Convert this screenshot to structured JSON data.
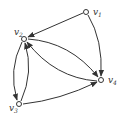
{
  "graph": {
    "type": "directed",
    "nodes": [
      {
        "id": "v1",
        "label": "v",
        "sub": "1",
        "x": 86,
        "y": 12
      },
      {
        "id": "v2",
        "label": "v",
        "sub": "2",
        "x": 24,
        "y": 39
      },
      {
        "id": "v3",
        "label": "v",
        "sub": "3",
        "x": 19,
        "y": 104
      },
      {
        "id": "v4",
        "label": "v",
        "sub": "4",
        "x": 101,
        "y": 80
      }
    ],
    "edges": [
      {
        "from": "v1",
        "to": "v2"
      },
      {
        "from": "v1",
        "to": "v4"
      },
      {
        "from": "v2",
        "to": "v4"
      },
      {
        "from": "v4",
        "to": "v2"
      },
      {
        "from": "v2",
        "to": "v3"
      },
      {
        "from": "v3",
        "to": "v2"
      },
      {
        "from": "v3",
        "to": "v4"
      }
    ],
    "colors": {
      "stroke": "#333333",
      "node_fill": "#ffffff"
    }
  }
}
